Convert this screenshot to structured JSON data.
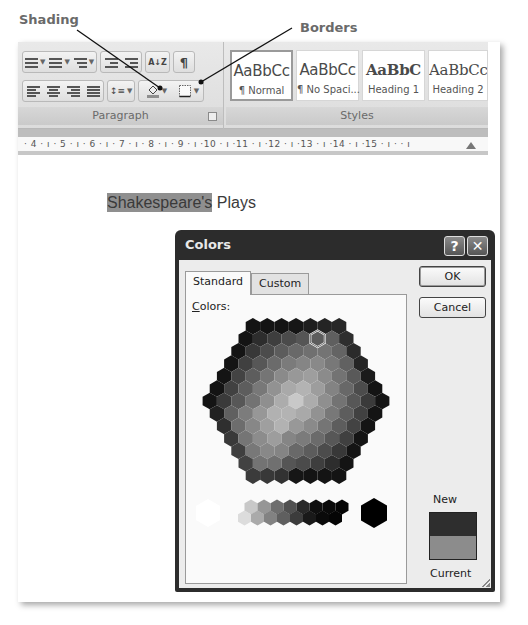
{
  "callouts": {
    "shading": "Shading",
    "borders": "Borders"
  },
  "ribbon": {
    "paragraph_group": {
      "label": "Paragraph",
      "row1": [
        {
          "icon": "bullets-icon",
          "has_dropdown": true
        },
        {
          "icon": "numbering-icon",
          "has_dropdown": true
        },
        {
          "icon": "multilevel-list-icon",
          "has_dropdown": true
        },
        {
          "icon": "decrease-indent-icon",
          "has_dropdown": false
        },
        {
          "icon": "increase-indent-icon",
          "has_dropdown": false
        },
        {
          "icon": "sort-icon",
          "glyph": "A↓Z",
          "has_dropdown": false
        },
        {
          "icon": "show-formatting-marks-icon",
          "glyph": "¶",
          "has_dropdown": false
        }
      ],
      "row2": [
        {
          "icon": "align-left-icon"
        },
        {
          "icon": "align-center-icon"
        },
        {
          "icon": "align-right-icon"
        },
        {
          "icon": "justify-icon"
        },
        {
          "icon": "line-spacing-icon",
          "has_dropdown": true
        },
        {
          "icon": "shading-icon",
          "has_dropdown": true
        },
        {
          "icon": "borders-icon",
          "has_dropdown": true
        }
      ]
    },
    "styles_group": {
      "label": "Styles",
      "tiles": [
        {
          "sample": "AaBbCc",
          "name": "¶ Normal",
          "selected": true
        },
        {
          "sample": "AaBbCc",
          "name": "¶ No Spaci...",
          "selected": false
        },
        {
          "sample": "AaBbC",
          "name": "Heading 1",
          "selected": false
        },
        {
          "sample": "AaBbCc",
          "name": "Heading 2",
          "selected": false
        }
      ]
    }
  },
  "ruler": {
    "text": "· 4 · ı · 5 · ı · 6 · ı · 7 · ı · 8 · ı · 9 · ı ·10 · ı ·11 · ı ·12 · ı ·13 · ı ·14 · ı ·15 · ı ·   · ı"
  },
  "document": {
    "shaded_text": "Shakespeare's",
    "plain_text": " Plays",
    "shading_color": "#8f8f8f"
  },
  "dialog": {
    "title": "Colors",
    "help_button": "?",
    "close_button": "✕",
    "tabs": [
      {
        "label": "Standard",
        "active": true
      },
      {
        "label": "Custom",
        "active": false
      }
    ],
    "colors_label_accel": "C",
    "colors_label_rest": "olors:",
    "ok_label": "OK",
    "cancel_label": "Cancel",
    "new_label": "New",
    "current_label": "Current",
    "new_color": "#2e2e2e",
    "current_color": "#8c8c8c"
  }
}
